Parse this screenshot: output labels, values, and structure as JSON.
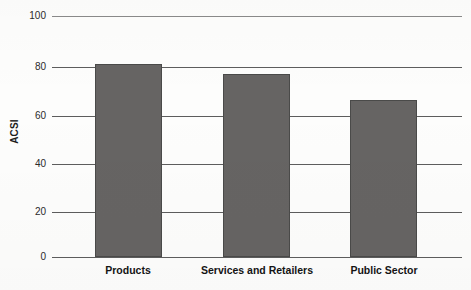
{
  "chart_data": {
    "type": "bar",
    "title": "",
    "xlabel": "",
    "ylabel": "ACSI",
    "categories": [
      "Products",
      "Services and Retailers",
      "Public Sector"
    ],
    "values": [
      80,
      76,
      65
    ],
    "ylim": [
      0,
      100
    ],
    "yticks": [
      0,
      20,
      40,
      60,
      80,
      100
    ],
    "ytick_labels": [
      "0",
      "20",
      "40",
      "60",
      "80",
      "100"
    ],
    "grid": true,
    "legend": false,
    "bar_color": "#666463",
    "bar_edge_color": "#4a4a49",
    "gridline_color": "#5d5d5d",
    "background_color": "#fdfdfc"
  }
}
